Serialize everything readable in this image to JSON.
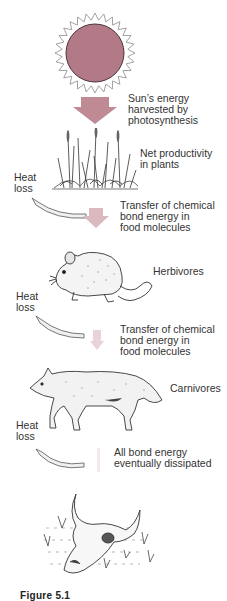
{
  "diagram": {
    "colors": {
      "sun_fill": "#b27a86",
      "sun_outline": "#4a3438",
      "arrow_strong": "#c08a95",
      "arrow_medium": "#dcb8bf",
      "arrow_light": "#ead3d8",
      "arrow_faint": "#f3e8ea",
      "heat_arrow_fill": "#f0f0f0",
      "heat_arrow_stroke": "#555555"
    },
    "stages": [
      {
        "id": "sun",
        "icon": "sun-icon"
      },
      {
        "id": "plants",
        "icon": "grass-plants-icon",
        "label": "Net productivity\nin plants"
      },
      {
        "id": "herbivores",
        "icon": "mouse-icon",
        "label": "Herbivores"
      },
      {
        "id": "carnivores",
        "icon": "coyote-icon",
        "label": "Carnivores"
      },
      {
        "id": "decomposition",
        "icon": "cattle-skull-icon"
      }
    ],
    "transfers": [
      {
        "label_line1": "Sun’s energy",
        "label_line2": "harvested by",
        "label_line3": "photosynthesis"
      },
      {
        "label_line1": "Transfer of chemical",
        "label_line2": "bond energy in",
        "label_line3": "food molecules"
      },
      {
        "label_line1": "Transfer of chemical",
        "label_line2": "bond energy in",
        "label_line3": "food molecules"
      },
      {
        "label_line1": "All bond energy",
        "label_line2": "eventually dissipated"
      }
    ],
    "heat_loss": [
      {
        "line1": "Heat",
        "line2": "loss"
      },
      {
        "line1": "Heat",
        "line2": "loss"
      },
      {
        "line1": "Heat",
        "line2": "loss"
      }
    ],
    "plants_label_line1": "Net productivity",
    "plants_label_line2": "in plants",
    "herbivores_label": "Herbivores",
    "carnivores_label": "Carnivores",
    "caption": "Figure 5.1"
  }
}
